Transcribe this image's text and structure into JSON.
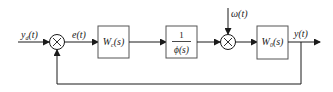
{
  "diagram": {
    "type": "block-diagram",
    "signals": {
      "input": {
        "label": "y",
        "sub": "d",
        "arg": "(t)"
      },
      "error": {
        "label": "e(t)"
      },
      "disturbance": {
        "label": "ω(t)"
      },
      "output": {
        "label": "y(t)"
      }
    },
    "junctions": [
      {
        "id": "sum1",
        "symbol": "×"
      },
      {
        "id": "sum2",
        "symbol": "×"
      }
    ],
    "blocks": [
      {
        "id": "controller",
        "label": "W",
        "sub": "c",
        "arg": "(s)"
      },
      {
        "id": "plant-inverse",
        "numerator": "1",
        "denominator": "ϕ(s)"
      },
      {
        "id": "plant",
        "label": "W",
        "sub": "0",
        "arg": "(s)"
      }
    ],
    "feedback": {
      "from": "output",
      "to": "sum1",
      "sign": ""
    }
  }
}
